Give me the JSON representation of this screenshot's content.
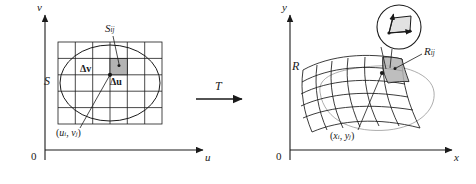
{
  "figure": {
    "stroke_color": "#1a1a1a",
    "fill_color": "#b3b3b3",
    "background": "#ffffff"
  },
  "left_panel": {
    "name": "uv-plane",
    "axes": {
      "horizontal_label": "u",
      "vertical_label": "v",
      "origin_label": "0"
    },
    "region_label": "S",
    "cell_label": "S",
    "cell_label_sub": "ij",
    "delta_v_label": "Δv",
    "delta_u_label": "Δu",
    "point_label_open": "(",
    "point_label_u": "u",
    "point_label_u_sub": "i",
    "point_label_comma": ", ",
    "point_label_v": "v",
    "point_label_v_sub": "j",
    "point_label_close": ")",
    "grid": {
      "columns": 6,
      "rows": 5
    }
  },
  "transform": {
    "label": "T"
  },
  "right_panel": {
    "name": "xy-plane",
    "axes": {
      "horizontal_label": "x",
      "vertical_label": "y",
      "origin_label": "0"
    },
    "region_label": "R",
    "cell_label": "R",
    "cell_label_sub": "ij",
    "point_label_open": "(",
    "point_label_x": "x",
    "point_label_x_sub": "i",
    "point_label_comma": ", ",
    "point_label_y": "y",
    "point_label_y_sub": "j",
    "point_label_close": ")",
    "magnifier": {
      "shape": "circle-inset",
      "content": "tangent-vector-parallelogram"
    }
  }
}
